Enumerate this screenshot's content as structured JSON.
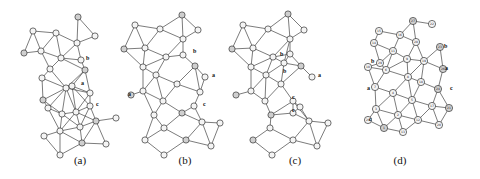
{
  "figure": {
    "panels": [
      {
        "id": "a",
        "caption": "(a)",
        "caption_x": 80,
        "annotations": [
          {
            "label": "b",
            "x": 86,
            "y": 60
          },
          {
            "label": "a",
            "x": 81,
            "y": 85
          },
          {
            "label": "c",
            "x": 96,
            "y": 106
          }
        ],
        "nodes": [
          [
            78,
            17
          ],
          [
            33,
            31
          ],
          [
            56,
            33
          ],
          [
            95,
            36
          ],
          [
            77,
            43
          ],
          [
            24,
            53
          ],
          [
            41,
            51
          ],
          [
            61,
            58
          ],
          [
            81,
            60
          ],
          [
            50,
            69
          ],
          [
            85,
            70
          ],
          [
            42,
            78
          ],
          [
            66,
            88
          ],
          [
            72,
            86
          ],
          [
            90,
            93
          ],
          [
            43,
            100
          ],
          [
            90,
            106
          ],
          [
            48,
            108
          ],
          [
            62,
            114
          ],
          [
            76,
            112
          ],
          [
            96,
            121
          ],
          [
            116,
            118
          ],
          [
            60,
            131
          ],
          [
            80,
            127
          ],
          [
            44,
            136
          ],
          [
            82,
            143
          ],
          [
            106,
            144
          ],
          [
            60,
            155
          ]
        ]
      },
      {
        "id": "b",
        "caption": "(b)",
        "caption_x": 185,
        "annotations": [
          {
            "label": "b",
            "x": 193,
            "y": 53
          },
          {
            "label": "a",
            "x": 212,
            "y": 77
          },
          {
            "label": "a",
            "x": 128,
            "y": 96
          },
          {
            "label": "c",
            "x": 203,
            "y": 106
          }
        ],
        "nodes": [
          [
            182,
            15
          ],
          [
            135,
            25
          ],
          [
            160,
            29
          ],
          [
            198,
            30
          ],
          [
            183,
            39
          ],
          [
            124,
            49
          ],
          [
            145,
            48
          ],
          [
            166,
            57
          ],
          [
            183,
            55
          ],
          [
            143,
            67
          ],
          [
            195,
            66
          ],
          [
            156,
            75
          ],
          [
            205,
            77
          ],
          [
            177,
            84
          ],
          [
            200,
            92
          ],
          [
            131,
            95
          ],
          [
            143,
            91
          ],
          [
            163,
            101
          ],
          [
            194,
            106
          ],
          [
            154,
            115
          ],
          [
            182,
            113
          ],
          [
            202,
            122
          ],
          [
            220,
            123
          ],
          [
            164,
            128
          ],
          [
            145,
            140
          ],
          [
            186,
            140
          ],
          [
            211,
            146
          ],
          [
            164,
            155
          ]
        ]
      },
      {
        "id": "c",
        "caption": "(c)",
        "caption_x": 295,
        "annotations": [
          {
            "label": "b",
            "x": 280,
            "y": 56
          },
          {
            "label": "b",
            "x": 283,
            "y": 73
          },
          {
            "label": "a",
            "x": 318,
            "y": 77
          },
          {
            "label": "c",
            "x": 292,
            "y": 99
          },
          {
            "label": "c",
            "x": 292,
            "y": 112
          }
        ],
        "nodes": [
          [
            288,
            14
          ],
          [
            243,
            25
          ],
          [
            268,
            29
          ],
          [
            304,
            30
          ],
          [
            290,
            39
          ],
          [
            232,
            49
          ],
          [
            253,
            48
          ],
          [
            273,
            57
          ],
          [
            290,
            54
          ],
          [
            284,
            63
          ],
          [
            301,
            66
          ],
          [
            251,
            67
          ],
          [
            266,
            75
          ],
          [
            312,
            77
          ],
          [
            281,
            84
          ],
          [
            236,
            95
          ],
          [
            251,
            91
          ],
          [
            293,
            101
          ],
          [
            300,
            107
          ],
          [
            265,
            101
          ],
          [
            271,
            115
          ],
          [
            293,
            113
          ],
          [
            309,
            121
          ],
          [
            328,
            123
          ],
          [
            270,
            128
          ],
          [
            253,
            140
          ],
          [
            293,
            140
          ],
          [
            317,
            146
          ],
          [
            272,
            155
          ]
        ]
      },
      {
        "id": "d",
        "caption": "(d)",
        "caption_x": 400,
        "annotations": [
          {
            "label": "b",
            "x": 371,
            "y": 63
          },
          {
            "label": "b",
            "x": 444,
            "y": 48
          },
          {
            "label": "a",
            "x": 367,
            "y": 90
          },
          {
            "label": "a",
            "x": 445,
            "y": 70
          },
          {
            "label": "c",
            "x": 369,
            "y": 121
          },
          {
            "label": "c",
            "x": 450,
            "y": 90
          }
        ],
        "nodes": [
          [
            413,
            21
          ],
          [
            432,
            24
          ],
          [
            379,
            31
          ],
          [
            400,
            35
          ],
          [
            416,
            42
          ],
          [
            440,
            47
          ],
          [
            374,
            43
          ],
          [
            393,
            51
          ],
          [
            407,
            59
          ],
          [
            424,
            61
          ],
          [
            443,
            69
          ],
          [
            368,
            67
          ],
          [
            386,
            70
          ],
          [
            408,
            77
          ],
          [
            421,
            82
          ],
          [
            438,
            89
          ],
          [
            375,
            87
          ],
          [
            393,
            93
          ],
          [
            412,
            100
          ],
          [
            432,
            106
          ],
          [
            449,
            108
          ],
          [
            376,
            109
          ],
          [
            398,
            115
          ],
          [
            418,
            120
          ],
          [
            439,
            125
          ],
          [
            384,
            128
          ],
          [
            403,
            132
          ],
          [
            368,
            120
          ],
          [
            380,
            63
          ]
        ],
        "node_labels": [
          "27",
          "22",
          "15",
          "16",
          "28",
          "23",
          "14",
          "11",
          "9",
          "19",
          "26",
          "10",
          "6",
          "8",
          "18",
          "24",
          "7",
          "4",
          "5",
          "17",
          "21",
          "3",
          "2",
          "12",
          "20",
          "1",
          "13",
          "29",
          "29"
        ]
      }
    ]
  }
}
